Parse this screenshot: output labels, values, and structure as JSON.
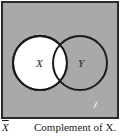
{
  "diagram": {
    "type": "venn",
    "universe_fill": "#a9a9a9",
    "frame_color": "#2a2a2a",
    "circles": [
      {
        "label": "X",
        "cx": 40,
        "cy": 63,
        "r": 27,
        "fill": "#ffffff"
      },
      {
        "label": "Y",
        "cx": 80,
        "cy": 63,
        "r": 27,
        "fill": "#a9a9a9"
      }
    ],
    "shaded_region": "everything outside X"
  },
  "caption": {
    "symbol": "X",
    "description": "Complement of X."
  }
}
